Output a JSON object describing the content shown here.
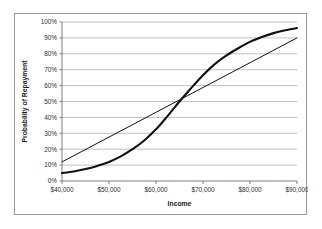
{
  "chart_data": {
    "type": "line",
    "title": "",
    "xlabel": "Income",
    "ylabel": "Probability of Repayment",
    "xlim": [
      40000,
      90000
    ],
    "ylim": [
      0,
      1.0
    ],
    "grid": true,
    "legend": "none",
    "x_ticks": [
      "$40,000",
      "$50,000",
      "$60,000",
      "$70,000",
      "$80,000",
      "$90,000"
    ],
    "x_tick_values": [
      40000,
      50000,
      60000,
      70000,
      80000,
      90000
    ],
    "y_ticks": [
      "0%",
      "10%",
      "20%",
      "30%",
      "40%",
      "50%",
      "60%",
      "70%",
      "80%",
      "90%",
      "100%"
    ],
    "y_tick_values": [
      0,
      0.1,
      0.2,
      0.3,
      0.4,
      0.5,
      0.6,
      0.7,
      0.8,
      0.9,
      1.0
    ],
    "x": [
      40000,
      42500,
      45000,
      47500,
      50000,
      52500,
      55000,
      57500,
      60000,
      62500,
      65000,
      67500,
      70000,
      72500,
      75000,
      77500,
      80000,
      82500,
      85000,
      87500,
      90000
    ],
    "series": [
      {
        "name": "Logistic (S-curve)",
        "style": "thick",
        "values": [
          0.05,
          0.06,
          0.075,
          0.095,
          0.12,
          0.155,
          0.2,
          0.255,
          0.325,
          0.41,
          0.5,
          0.585,
          0.665,
          0.735,
          0.79,
          0.835,
          0.875,
          0.905,
          0.93,
          0.948,
          0.962
        ]
      },
      {
        "name": "Linear",
        "style": "thin",
        "values": [
          0.12,
          0.159,
          0.198,
          0.237,
          0.276,
          0.315,
          0.354,
          0.393,
          0.432,
          0.471,
          0.51,
          0.549,
          0.588,
          0.627,
          0.666,
          0.705,
          0.744,
          0.783,
          0.822,
          0.861,
          0.9
        ]
      }
    ],
    "annotations": [
      {
        "text": "curves intersect near $62,500 at about 45%"
      }
    ],
    "colors": {
      "series_stroke": "#111111",
      "gridline": "#a6a6a6",
      "axis": "#6f6f6f",
      "border": "#9a9a9a",
      "background": "#ffffff",
      "tick_text": "#2b2b2b"
    }
  }
}
